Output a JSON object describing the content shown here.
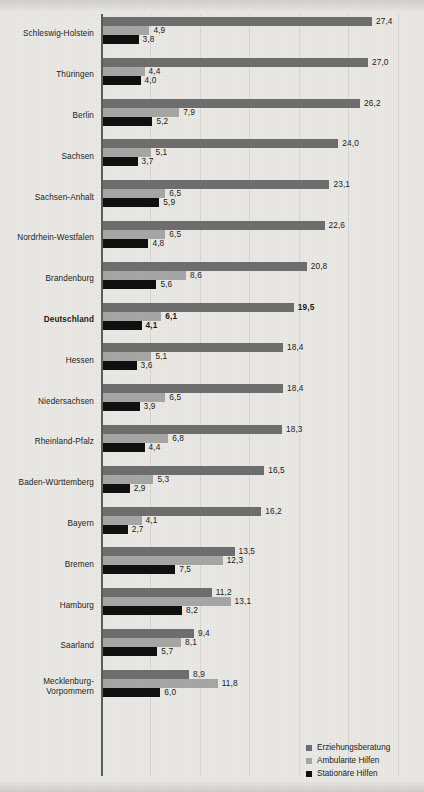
{
  "chart_data": {
    "type": "bar",
    "orientation": "horizontal",
    "title": "",
    "subtitle": "",
    "xlabel": "",
    "ylabel": "",
    "xlim": [
      0,
      32.6
    ],
    "grid": true,
    "gridlines": [
      5,
      10,
      15,
      20,
      25,
      30
    ],
    "legend_position": "bottom-right",
    "categories": [
      "Schleswig-Holstein",
      "Thüringen",
      "Berlin",
      "Sachsen",
      "Sachsen-Anhalt",
      "Nordrhein-Westfalen",
      "Brandenburg",
      "Deutschland",
      "Hessen",
      "Niedersachsen",
      "Rheinland-Pfalz",
      "Baden-Württemberg",
      "Bayern",
      "Bremen",
      "Hamburg",
      "Saarland",
      "Mecklenburg-Vorpommern"
    ],
    "highlight_category": "Deutschland",
    "series": [
      {
        "name": "Erziehungsberatung",
        "color": "#6e6e6e",
        "values": [
          27.4,
          27.0,
          26.2,
          24.0,
          23.1,
          22.6,
          20.8,
          19.5,
          18.4,
          18.4,
          18.3,
          16.5,
          16.2,
          13.5,
          11.2,
          9.4,
          8.9
        ],
        "labels": [
          "27,4",
          "27,0",
          "26,2",
          "24,0",
          "23,1",
          "22,6",
          "20,8",
          "19,5",
          "18,4",
          "18,4",
          "18,3",
          "16,5",
          "16,2",
          "13,5",
          "11,2",
          "9,4",
          "8,9"
        ]
      },
      {
        "name": "Ambulante Hilfen",
        "color": "#a6a6a4",
        "values": [
          4.9,
          4.4,
          7.9,
          5.1,
          6.5,
          6.5,
          8.6,
          6.1,
          5.1,
          6.5,
          6.8,
          5.3,
          4.1,
          12.3,
          13.1,
          8.1,
          11.8
        ],
        "labels": [
          "4,9",
          "4,4",
          "7,9",
          "5,1",
          "6,5",
          "6,5",
          "8,6",
          "6,1",
          "5,1",
          "6,5",
          "6,8",
          "5,3",
          "4,1",
          "12,3",
          "13,1",
          "8,1",
          "11,8"
        ]
      },
      {
        "name": "Stationäre Hilfen",
        "color": "#101010",
        "values": [
          3.8,
          4.0,
          5.2,
          3.7,
          5.9,
          4.8,
          5.6,
          4.1,
          3.6,
          3.9,
          4.4,
          2.9,
          2.7,
          7.5,
          8.2,
          5.7,
          6.0
        ],
        "labels": [
          "3,8",
          "4,0",
          "5,2",
          "3,7",
          "5,9",
          "4,8",
          "5,6",
          "4,1",
          "3,6",
          "3,9",
          "4,4",
          "2,9",
          "2,7",
          "7,5",
          "8,2",
          "5,7",
          "6,0"
        ]
      }
    ]
  },
  "legend": {
    "items": [
      {
        "label": "Erziehungsberatung",
        "color": "#6e6e6e"
      },
      {
        "label": "Ambulante Hilfen",
        "color": "#a6a6a4"
      },
      {
        "label": "Stationäre Hilfen",
        "color": "#101010"
      }
    ]
  }
}
